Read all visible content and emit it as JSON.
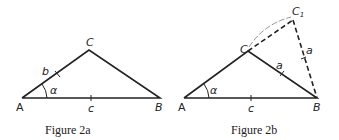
{
  "figures": [
    {
      "caption": "Figure 2a",
      "vertices": {
        "A": "A",
        "B": "B",
        "C": "C"
      },
      "sides": {
        "b": "b",
        "c": "c"
      },
      "angle": "α"
    },
    {
      "caption": "Figure 2b",
      "vertices": {
        "A": "A",
        "B": "B",
        "C": "C",
        "C1": "C",
        "C1_sub": "1"
      },
      "sides": {
        "a": "a",
        "a_dashed": "a",
        "c": "c"
      },
      "angle": "α"
    }
  ]
}
